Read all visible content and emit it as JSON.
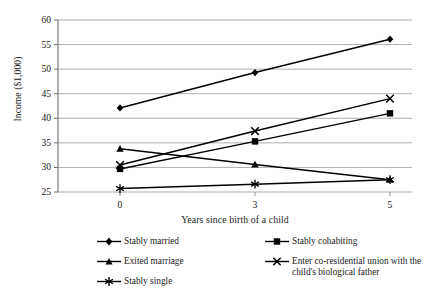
{
  "chart_data": {
    "type": "line",
    "title": "",
    "xlabel": "Years since birth of a child",
    "ylabel": "Income ($1,000)",
    "x": [
      0,
      3,
      5
    ],
    "xtick_labels": [
      "0",
      "3",
      "5"
    ],
    "ytick_labels": [
      "25",
      "30",
      "35",
      "40",
      "45",
      "50",
      "55",
      "60"
    ],
    "yticks": [
      25,
      30,
      35,
      40,
      45,
      50,
      55,
      60
    ],
    "ylim": [
      25,
      60
    ],
    "grid": "horizontal",
    "legend_position": "bottom",
    "series": [
      {
        "name": "Stably married",
        "marker": "diamond",
        "values": [
          42.1,
          49.3,
          56.1
        ],
        "color": "#000000"
      },
      {
        "name": "Stably cohabiting",
        "marker": "square",
        "values": [
          29.7,
          35.3,
          41.0
        ],
        "color": "#000000"
      },
      {
        "name": "Exited marriage",
        "marker": "triangle",
        "values": [
          33.8,
          30.6,
          27.5
        ],
        "color": "#000000"
      },
      {
        "name": "Enter co-residential union with the child's biological father",
        "marker": "cross",
        "values": [
          30.5,
          37.4,
          44.0
        ],
        "color": "#000000"
      },
      {
        "name": "Stably single",
        "marker": "star",
        "values": [
          25.7,
          26.6,
          27.5
        ],
        "color": "#000000"
      }
    ]
  },
  "legend": {
    "items": [
      {
        "label": "Stably married",
        "marker": "diamond"
      },
      {
        "label": "Stably cohabiting",
        "marker": "square"
      },
      {
        "label": "Exited marriage",
        "marker": "triangle"
      },
      {
        "label": "Enter co-residential union with the child's biological father",
        "marker": "cross"
      },
      {
        "label": "Stably single",
        "marker": "star"
      }
    ]
  },
  "axes": {
    "y_title": "Income ($1,000)",
    "x_title": "Years since birth of a child"
  }
}
